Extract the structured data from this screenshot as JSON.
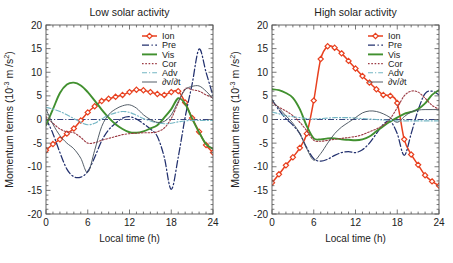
{
  "figure": {
    "width": 453,
    "height": 263,
    "background": "#ffffff"
  },
  "panels": [
    {
      "id": "low-solar-activity",
      "title": "Low solar activity",
      "xlabel": "Local time (h)",
      "ylabel": "Momentum terms (10",
      "ylabel_sup": "-3",
      "ylabel_tail": " m /s",
      "ylabel_sup2": "2",
      "ylabel_close": ")",
      "show_ylabel": true,
      "show_legend": true
    },
    {
      "id": "high-solar-activity",
      "title": "High solar activity",
      "xlabel": "Local time (h)",
      "ylabel": "Momentum terms (10",
      "ylabel_sup": "-3",
      "ylabel_tail": " m /s",
      "ylabel_sup2": "2",
      "ylabel_close": ")",
      "show_ylabel": true,
      "show_legend": true
    }
  ],
  "axes": {
    "x_ticks": [
      "0",
      "6",
      "12",
      "18",
      "24"
    ],
    "y_ticks": [
      "20",
      "15",
      "10",
      "5",
      "0",
      "-5",
      "-10",
      "-15",
      "-20"
    ],
    "xlim": [
      0,
      24
    ],
    "ylim": [
      -20,
      20
    ],
    "x_major_step": 6,
    "y_major_step": 5,
    "x_minor_per_major": 6,
    "y_minor_per_major": 5,
    "grid": false,
    "tick_direction": "in",
    "frame": true
  },
  "legend": {
    "position": "top-right",
    "entries": [
      {
        "label": "Ion",
        "color": "#e8401f",
        "style": "solid-markers",
        "marker": "diamond"
      },
      {
        "label": "Pre",
        "color": "#22306e",
        "style": "dashdot",
        "marker": "none"
      },
      {
        "label": "Vis",
        "color": "#41902f",
        "style": "solid",
        "marker": "none"
      },
      {
        "label": "Cor",
        "color": "#9c3b44",
        "style": "dotted",
        "marker": "none"
      },
      {
        "label": "Adv",
        "color": "#74b6c4",
        "style": "dashdot-thin",
        "marker": "none"
      },
      {
        "label": "∂v/∂t",
        "color": "#4b5560",
        "style": "solid-thin",
        "marker": "none"
      }
    ]
  },
  "colors": {
    "ion": "#e8401f",
    "pre": "#22306e",
    "vis": "#41902f",
    "cor": "#9c3b44",
    "adv": "#74b6c4",
    "dvdt": "#4b5560",
    "axis": "#555555",
    "text": "#222222",
    "zero_line": "#22306e"
  },
  "chart_data": [
    {
      "type": "line",
      "title": "Low solar activity",
      "xlabel": "Local time (h)",
      "ylabel": "Momentum terms (10^-3 m /s^2)",
      "xlim": [
        0,
        24
      ],
      "ylim": [
        -20,
        20
      ],
      "grid": false,
      "legend_position": "top-right",
      "x": [
        0,
        1,
        2,
        3,
        4,
        5,
        6,
        7,
        8,
        9,
        10,
        11,
        12,
        13,
        14,
        15,
        16,
        17,
        18,
        19,
        20,
        21,
        22,
        23,
        24
      ],
      "series": [
        {
          "name": "Ion",
          "color": "#e8401f",
          "marker": "diamond",
          "values": [
            -6.5,
            -5.2,
            -4.2,
            -3.0,
            -1.9,
            -0.2,
            1.5,
            2.8,
            3.9,
            4.4,
            4.8,
            5.2,
            5.8,
            6.3,
            6.2,
            5.8,
            5.4,
            5.2,
            5.8,
            6.0,
            3.6,
            0.3,
            -2.6,
            -5.4,
            -7.0
          ]
        },
        {
          "name": "Pre",
          "color": "#22306e",
          "values": [
            0.2,
            -3.0,
            -7.0,
            -10.5,
            -12.1,
            -12.2,
            -11.0,
            -8.0,
            -4.5,
            -2.2,
            -0.8,
            0.3,
            0.6,
            0.1,
            -0.9,
            -2.0,
            -3.6,
            -8.0,
            -14.8,
            -8.0,
            0.5,
            7.5,
            14.9,
            10.0,
            5.0
          ]
        },
        {
          "name": "Vis",
          "color": "#41902f",
          "values": [
            -1.2,
            2.2,
            5.6,
            7.4,
            7.8,
            7.2,
            5.8,
            4.0,
            2.1,
            0.4,
            -1.0,
            -2.0,
            -2.7,
            -2.8,
            -2.5,
            -1.9,
            -1.2,
            0.4,
            2.2,
            4.5,
            3.3,
            0.2,
            -2.7,
            -5.2,
            -6.2
          ]
        },
        {
          "name": "Cor",
          "color": "#9c3b44",
          "values": [
            0.6,
            -0.8,
            -2.0,
            -2.6,
            -2.8,
            -3.8,
            -5.0,
            -4.9,
            -4.4,
            -4.0,
            -3.6,
            -3.2,
            -3.0,
            -2.9,
            -2.8,
            -2.8,
            -2.6,
            -1.8,
            0.2,
            3.5,
            6.5,
            6.3,
            6.0,
            5.2,
            4.6
          ]
        },
        {
          "name": "Adv",
          "color": "#74b6c4",
          "values": [
            2.6,
            2.2,
            1.7,
            1.0,
            0.2,
            -0.6,
            -1.1,
            -0.8,
            0.1,
            0.9,
            1.4,
            1.7,
            1.5,
            0.9,
            0.2,
            -0.3,
            -0.7,
            -0.9,
            -0.8,
            -0.5,
            -0.3,
            -0.2,
            -0.2,
            -0.2,
            -0.2
          ]
        },
        {
          "name": "dv/dt",
          "color": "#4b5560",
          "values": [
            2.2,
            -1.0,
            -3.4,
            -5.0,
            -6.2,
            -8.2,
            -11.2,
            -6.5,
            -1.5,
            1.0,
            2.2,
            2.9,
            3.1,
            2.4,
            1.0,
            0.0,
            -0.6,
            -0.4,
            1.0,
            3.8,
            6.3,
            7.0,
            7.1,
            6.0,
            4.4
          ]
        }
      ]
    },
    {
      "type": "line",
      "title": "High solar activity",
      "xlabel": "Local time (h)",
      "ylabel": "Momentum terms (10^-3 m /s^2)",
      "xlim": [
        0,
        24
      ],
      "ylim": [
        -20,
        20
      ],
      "grid": false,
      "legend_position": "top-right",
      "x": [
        0,
        1,
        2,
        3,
        4,
        5,
        6,
        7,
        8,
        9,
        10,
        11,
        12,
        13,
        14,
        15,
        16,
        17,
        18,
        19,
        20,
        21,
        22,
        23,
        24
      ],
      "series": [
        {
          "name": "Ion",
          "color": "#e8401f",
          "marker": "diamond",
          "values": [
            -13.4,
            -11.6,
            -9.7,
            -8.0,
            -6.0,
            -3.0,
            4.0,
            12.8,
            15.5,
            15.2,
            14.0,
            12.4,
            10.8,
            9.2,
            7.8,
            6.4,
            5.2,
            5.0,
            3.5,
            -4.2,
            -7.4,
            -9.6,
            -11.8,
            -13.1,
            -14.0
          ]
        },
        {
          "name": "Pre",
          "color": "#22306e",
          "values": [
            4.2,
            2.0,
            0.2,
            -1.2,
            -3.0,
            -6.0,
            -8.3,
            -8.8,
            -8.4,
            -7.6,
            -7.0,
            -6.8,
            -7.0,
            -6.4,
            -5.0,
            -3.0,
            -1.0,
            -0.4,
            -3.0,
            -7.6,
            -3.0,
            2.0,
            5.5,
            6.0,
            5.2
          ]
        },
        {
          "name": "Vis",
          "color": "#41902f",
          "values": [
            6.4,
            6.2,
            5.6,
            4.6,
            2.2,
            -1.4,
            -4.0,
            -4.2,
            -4.0,
            -4.0,
            -4.2,
            -4.3,
            -4.4,
            -4.2,
            -3.6,
            -2.5,
            -1.4,
            -0.4,
            0.4,
            1.2,
            1.6,
            2.2,
            3.4,
            5.2,
            6.2
          ]
        },
        {
          "name": "Cor",
          "color": "#9c3b44",
          "values": [
            3.6,
            2.6,
            1.8,
            0.8,
            -0.6,
            -2.4,
            -4.4,
            -4.6,
            -4.4,
            -4.2,
            -4.0,
            -3.8,
            -3.6,
            -3.2,
            -2.6,
            -2.0,
            -1.2,
            0.2,
            2.5,
            5.0,
            6.0,
            5.8,
            4.5,
            3.0,
            2.2
          ]
        },
        {
          "name": "Adv",
          "color": "#74b6c4",
          "values": [
            1.6,
            1.2,
            0.8,
            0.6,
            0.4,
            0.2,
            0.1,
            0.2,
            0.3,
            0.4,
            0.4,
            0.4,
            0.3,
            0.2,
            0.1,
            0.0,
            -0.1,
            -0.2,
            -0.3,
            -0.3,
            -0.3,
            -0.3,
            -0.3,
            -0.3,
            -0.3
          ]
        },
        {
          "name": "dv/dt",
          "color": "#4b5560",
          "values": [
            4.0,
            2.4,
            0.8,
            -0.8,
            -3.0,
            -6.2,
            -8.6,
            -7.2,
            -5.0,
            -3.0,
            -1.6,
            -0.6,
            0.4,
            1.4,
            1.8,
            1.7,
            1.2,
            0.4,
            -0.6,
            0.6,
            1.6,
            2.0,
            2.1,
            2.1,
            2.1
          ]
        }
      ]
    }
  ]
}
